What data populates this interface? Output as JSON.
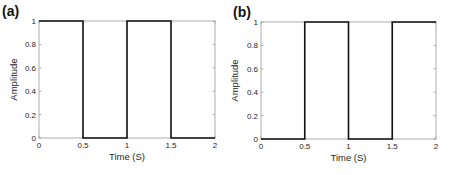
{
  "chart_data": [
    {
      "type": "line",
      "panel_label": "(a)",
      "title": "",
      "xlabel": "Time (S)",
      "ylabel": "Amplitude",
      "xlim": [
        0,
        2
      ],
      "ylim": [
        0,
        1
      ],
      "xticks": [
        "0",
        "0.5",
        "1",
        "1.5",
        "2"
      ],
      "yticks": [
        "0",
        "0.2",
        "0.4",
        "0.6",
        "0.8",
        "1"
      ],
      "grid": false,
      "legend": null,
      "series": [
        {
          "name": "square wave (a)",
          "x": [
            0,
            0.5,
            0.5,
            1,
            1,
            1.5,
            1.5,
            2
          ],
          "y": [
            1,
            1,
            0,
            0,
            1,
            1,
            0,
            0
          ]
        }
      ]
    },
    {
      "type": "line",
      "panel_label": "(b)",
      "title": "",
      "xlabel": "Time (S)",
      "ylabel": "Amplitude",
      "xlim": [
        0,
        2
      ],
      "ylim": [
        0,
        1
      ],
      "xticks": [
        "0",
        "0.5",
        "1",
        "1.5",
        "2"
      ],
      "yticks": [
        "0",
        "0.2",
        "0.4",
        "0.6",
        "0.8",
        "1"
      ],
      "grid": false,
      "legend": null,
      "series": [
        {
          "name": "square wave (b)",
          "x": [
            0,
            0.5,
            0.5,
            1,
            1,
            1.5,
            1.5,
            2
          ],
          "y": [
            0,
            0,
            1,
            1,
            0,
            0,
            1,
            1
          ]
        }
      ]
    }
  ],
  "colors": {
    "line": "#111111",
    "axes": "#9a9a9a",
    "text": "#262626"
  }
}
